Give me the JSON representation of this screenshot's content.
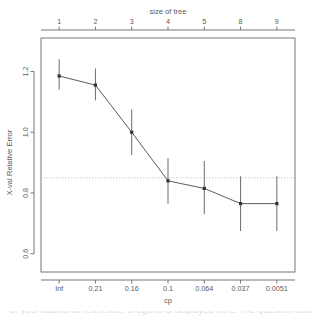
{
  "chart_data": {
    "type": "line",
    "title": "",
    "xlabel": "cp",
    "ylabel": "X-val Relative Error",
    "top_axis_label": "size of tree",
    "x_tick_labels": [
      "Inf",
      "0.21",
      "0.16",
      "0.1",
      "0.064",
      "0.037",
      "0.0051"
    ],
    "top_tick_labels": [
      "1",
      "2",
      "3",
      "4",
      "5",
      "8",
      "9"
    ],
    "y_tick_labels": [
      "1.2",
      "1.0",
      "0.8",
      "0.6"
    ],
    "y_ticks": [
      1.2,
      1.0,
      0.8,
      0.6
    ],
    "ylim": [
      0.54,
      1.31
    ],
    "grid": false,
    "legend": "none",
    "reference_line": {
      "y": 0.85,
      "style": "dotted",
      "color": "#c9c9c9"
    },
    "categories": [
      "Inf",
      "0.21",
      "0.16",
      "0.1",
      "0.064",
      "0.037",
      "0.0051"
    ],
    "tree_size": [
      1,
      2,
      3,
      4,
      5,
      8,
      9
    ],
    "values": [
      1.185,
      1.155,
      1.0,
      0.84,
      0.815,
      0.765,
      0.765
    ],
    "error_low": [
      1.14,
      1.105,
      0.925,
      0.765,
      0.73,
      0.675,
      0.675
    ],
    "error_high": [
      1.24,
      1.21,
      1.075,
      0.915,
      0.905,
      0.855,
      0.855
    ],
    "series": [
      {
        "name": "X-val Relative Error",
        "values": [
          1.185,
          1.155,
          1.0,
          0.84,
          0.815,
          0.765,
          0.765
        ]
      }
    ]
  },
  "footer": {
    "clipped_text": "For your additional reference, a legend is displayed here. The question also covers"
  },
  "colors": {
    "axis": "#767676",
    "line": "#4a4a4a",
    "point": "#333333",
    "errorbar": "#6b6b6b",
    "reference": "#c9c9c9",
    "background": "#ffffff"
  }
}
